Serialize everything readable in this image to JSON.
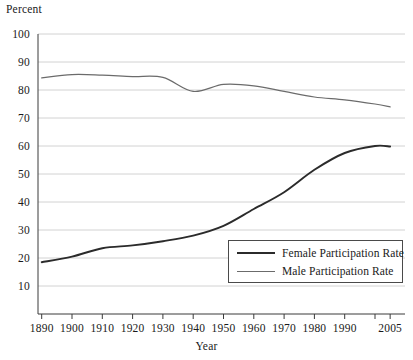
{
  "chart_data": {
    "type": "line",
    "title": "",
    "xlabel": "Year",
    "ylabel": "Percent",
    "ylim": [
      0,
      100
    ],
    "xlim": [
      1890,
      2005
    ],
    "grid": true,
    "legend_position": "inside-bottom-right",
    "ytick_labels": [
      "100",
      "90",
      "80",
      "70",
      "60",
      "50",
      "40",
      "30",
      "20",
      "10"
    ],
    "ytick_values": [
      100,
      90,
      80,
      70,
      60,
      50,
      40,
      30,
      20,
      10
    ],
    "xtick_labels": [
      "1890",
      "1900",
      "1910",
      "1920",
      "1930",
      "1940",
      "1950",
      "1960",
      "1970",
      "1980",
      "1990",
      "",
      "2005"
    ],
    "xtick_values": [
      1890,
      1900,
      1910,
      1920,
      1930,
      1940,
      1950,
      1960,
      1970,
      1980,
      1990,
      2000,
      2005
    ],
    "x": [
      1890,
      1900,
      1910,
      1920,
      1930,
      1940,
      1950,
      1960,
      1970,
      1980,
      1990,
      2000,
      2005
    ],
    "series": [
      {
        "name": "Female Participation Rate",
        "color": "#2b2b2b",
        "width": 1.9,
        "values": [
          18.5,
          20.5,
          23.5,
          24.5,
          26.0,
          28.0,
          31.5,
          37.5,
          43.5,
          51.5,
          57.5,
          60.0,
          59.8
        ]
      },
      {
        "name": "Male Participation Rate",
        "color": "#6b6b6b",
        "width": 1.2,
        "values": [
          84.3,
          85.5,
          85.3,
          84.8,
          84.5,
          79.5,
          82.0,
          81.5,
          79.5,
          77.5,
          76.5,
          75.0,
          74.0
        ]
      }
    ]
  },
  "legend": {
    "items": [
      {
        "label": "Female Participation Rate"
      },
      {
        "label": "Male Participation Rate"
      }
    ]
  },
  "axes": {
    "y_axis_title": "Percent",
    "x_axis_title": "Year"
  }
}
